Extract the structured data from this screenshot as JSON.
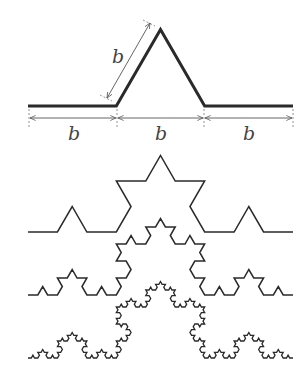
{
  "figure": {
    "generator": {
      "segment_label": "b",
      "bottom_labels": [
        "b",
        "b",
        "b"
      ],
      "slant_label": "b"
    },
    "iterations": [
      {
        "level": 1,
        "baseline_y": 106,
        "x0": 28,
        "x1": 293
      },
      {
        "level": 2,
        "baseline_y": 232,
        "x0": 28,
        "x1": 293
      },
      {
        "level": 3,
        "baseline_y": 295,
        "x0": 28,
        "x1": 293
      },
      {
        "level": 4,
        "baseline_y": 358,
        "x0": 28,
        "x1": 293
      }
    ],
    "colors": {
      "line": "#2a2a2a",
      "dimension": "#555555"
    }
  }
}
